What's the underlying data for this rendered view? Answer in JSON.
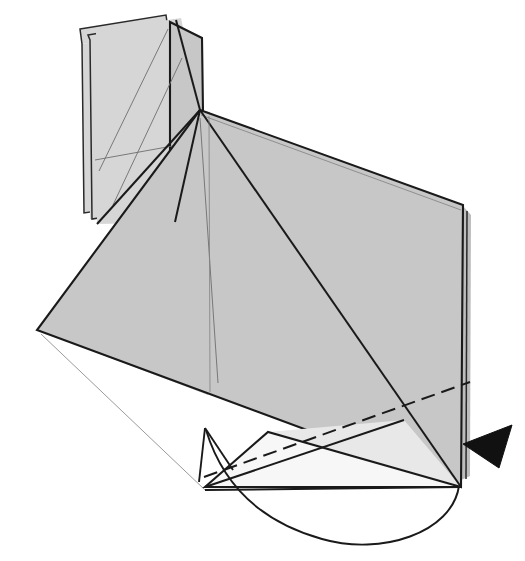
{
  "figure": {
    "kind": "origami-fold-diagram",
    "title": "Origami folding step diagram",
    "canvas": {
      "width": 525,
      "height": 561
    },
    "background_color": "#ffffff"
  },
  "palette": {
    "paper_mid_gray": "#c7c7c7",
    "paper_light_gray": "#d6d6d6",
    "paper_pale_gray": "#e8e8e8",
    "paper_white": "#f7f7f7",
    "paper_edge_gray": "#bdbdbd",
    "line_black": "#1a1a1a",
    "crease_gray": "#6e6e6e",
    "arrowhead_black": "#111111"
  },
  "shapes": {
    "back_flap_far": {
      "name": "back-upright-flap-far",
      "fill": "#d6d6d6",
      "points": "80,29 166,15 168,29 82,44"
    },
    "back_flap_far_body": {
      "name": "back-upright-flap-far-body",
      "fill": "#d6d6d6",
      "points": "82,44 168,29 170,200 84,213"
    },
    "back_flap_near": {
      "name": "back-upright-flap-near",
      "fill": "#d2d2d2",
      "points": "88,35 176,20 196,106 196,218 90,219"
    },
    "upper_left_panel": {
      "name": "upper-left-panel",
      "fill": "#cfcfcf",
      "points": "96,31 181,18 200,110 186,222 97,224"
    },
    "middle_flap": {
      "name": "middle-upright-flap",
      "fill": "#cacaca",
      "points": "170,22 202,38 203,112 200,110 186,225 170,214"
    },
    "main_panel": {
      "name": "main-large-panel",
      "fill": "#c7c7c7",
      "points": "200,110 463,205 461,487 37,330"
    },
    "main_panel_left_wing": {
      "name": "main-panel-left-wing",
      "fill": "#c9c9c9",
      "points": "200,110 37,330 208,395 210,112"
    },
    "right_thin_layer": {
      "name": "right-thin-back-layer",
      "fill": "#bdbdbd",
      "points": "463,206 471,215 470,476 461,480"
    },
    "lower_pale_flap": {
      "name": "lower-pale-under-flap",
      "fill": "#f4f4f4",
      "points": "205,487 268,432 461,487"
    },
    "lower_pale_flap2": {
      "name": "lower-pale-under-flap-secondary",
      "fill": "#ededed",
      "points": "268,432 461,487 404,420"
    }
  },
  "outlines": {
    "main_panel_outline": "M200,110 L463,205 L461,487 L37,330 Z",
    "main_panel_double_top": "M201,115 L461,210",
    "main_panel_double_left": "M41,334 L205,490",
    "right_edge_double": "M467,211 L466,479",
    "lower_flap_outline": "M205,487 L268,432 L461,487 Z",
    "left_flap_far_outline": "M80,29 L166,15 L168,29 L170,200 L84,213 L82,44 Z",
    "left_flap_near_outline": "M88,35 L176,20 L178,34 L180,205 L92,219 L90,40 Z",
    "mid_flap_outline": "M170,22 L202,38 L203,112 L200,110 L186,225 L170,214 Z"
  },
  "creases": {
    "apex_to_bottom_center": "M200,118 L218,383",
    "apex_to_right_low": "M200,110 L461,487",
    "apex_to_left_edge": "M200,110 L175,222",
    "apex_fan_left": "M200,110 L97,224",
    "upper_left_diag_a": "M113,205 L182,58",
    "upper_left_diag_b": "M95,160 L178,145",
    "upper_left_diag_c": "M168,29 L99,171",
    "mid_flap_diag": "M176,20 L200,110",
    "left_wing_vertical": "M209,116 L210,392",
    "lower_flap_cross": "M205,487 L404,420",
    "bottom_edge_main": "M205,490 L461,487"
  },
  "fold_lines": {
    "valley_dashed": {
      "name": "valley-fold-dashed-line",
      "path": "M204,477 L470,382",
      "style": "dashed"
    }
  },
  "arrows": {
    "curved_motion_arrow": {
      "name": "curved-motion-arrow",
      "tail_path": "M459,486 C452,533 381,556 322,539 C268,524 225,492 206,430",
      "head_tip": "205,428",
      "head_barb_left": "199,482",
      "head_barb_right": "233,470",
      "style": "open-two-line-head",
      "meaning": "fold the lower flap around and upward"
    },
    "push_arrowhead": {
      "name": "push-arrowhead-solid",
      "points": "463,444 512,425 499,468",
      "fill": "#111111",
      "direction": "left",
      "meaning": "press / push the right edge inward"
    }
  },
  "labels": {
    "count": 0,
    "text_items": []
  }
}
